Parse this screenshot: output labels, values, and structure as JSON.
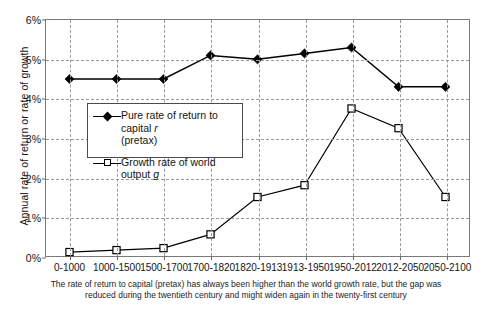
{
  "chart_data": {
    "type": "line",
    "title": "",
    "xlabel": "",
    "ylabel": "Annual rate of return or rate of growth",
    "categories": [
      "0-1000",
      "1000-1500",
      "1500-1700",
      "1700-1820",
      "1820-1913",
      "1913-1950",
      "1950-2012",
      "2012-2050",
      "2050-2100"
    ],
    "series": [
      {
        "name": "Pure rate of return to capital r (pretax)",
        "marker": "filled-diamond",
        "values": [
          4.5,
          4.5,
          4.5,
          5.1,
          5.0,
          5.15,
          5.3,
          4.3,
          4.3
        ]
      },
      {
        "name": "Growth rate of world output g",
        "marker": "open-square",
        "values": [
          0.1,
          0.15,
          0.2,
          0.55,
          1.5,
          1.8,
          3.75,
          3.25,
          1.5
        ]
      }
    ],
    "ylim": [
      0,
      6
    ],
    "y_ticks": [
      "0%",
      "1%",
      "2%",
      "3%",
      "4%",
      "5%",
      "6%"
    ],
    "y_tick_values": [
      0,
      1,
      2,
      3,
      4,
      5,
      6
    ],
    "grid": true,
    "legend_position": "center-left-inside",
    "annotations": []
  },
  "axes": {
    "y_title": "Annual rate of return or rate of growth",
    "y_ticks": [
      "0%",
      "1%",
      "2%",
      "3%",
      "4%",
      "5%",
      "6%"
    ],
    "x_ticks": [
      "0-1000",
      "1000-1500",
      "1500-1700",
      "1700-1820",
      "1820-1913",
      "1913-1950",
      "1950-2012",
      "2012-2050",
      "2050-2100"
    ]
  },
  "legend": {
    "entries": [
      {
        "label_part1": "Pure rate of return to capital ",
        "variable": "r",
        "label_part2": "(pretax)"
      },
      {
        "label_part1": "Growth rate of world output ",
        "variable": "g",
        "label_part2": ""
      }
    ]
  },
  "caption": {
    "line1": "The rate of return to capital (pretax) has always been higher than the world growth rate, but the gap was",
    "line2": "reduced during the twentieth century and might widen again in the twenty-first century"
  },
  "colors": {
    "series_r": "#000000",
    "series_g": "#000000",
    "grid": "#9a9a9a",
    "frame": "#7a7a7a",
    "text": "#141414"
  }
}
